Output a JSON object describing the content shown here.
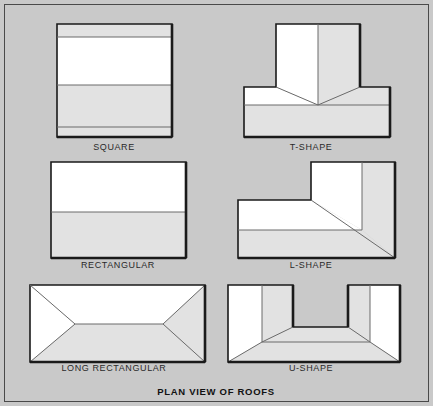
{
  "figure": {
    "caption": "PLAN VIEW OF ROOFS",
    "background_color": "#c9c9c9",
    "frame_color": "#4a4a4a",
    "face_light_color": "#ffffff",
    "face_shade_color": "#e2e2e2",
    "outline_color": "#1a1a1a",
    "ridge_line_color": "#6b6b6b"
  },
  "diagrams": [
    {
      "id": "square",
      "label": "SQUARE",
      "roof_type": "gable",
      "description": "Square plan with ridge running horizontally and narrow eave bands top and bottom",
      "label_x": 114,
      "label_y": 150,
      "outline": "57,24 172,24 172,137 57,137",
      "faces": [
        {
          "name": "upper-eave-band",
          "shade": "shade",
          "points": "57,24 172,24 172,37 57,37"
        },
        {
          "name": "upper-slope",
          "shade": "light",
          "points": "57,37 172,37 172,85 57,85"
        },
        {
          "name": "lower-slope",
          "shade": "shade",
          "points": "57,85 172,85 172,127 57,127"
        },
        {
          "name": "lower-eave-band",
          "shade": "shade",
          "points": "57,127 172,127 172,137 57,137"
        }
      ],
      "lines": [
        "57,37 172,37",
        "57,85 172,85",
        "57,127 172,127"
      ],
      "heavy_edges": [
        "57,137 172,137",
        "172,24 172,137"
      ]
    },
    {
      "id": "t-shape",
      "label": "T-SHAPE",
      "roof_type": "intersecting-gable",
      "description": "T plan with vertical ridge down the stem meeting a horizontal main ridge at a valley point",
      "label_x": 311,
      "label_y": 150,
      "outline": "276,24 360,24 360,87 390,87 390,137 244,137 244,87 276,87",
      "faces": [
        {
          "name": "stem-left-slope",
          "shade": "light",
          "points": "276,24 318,24 318,105 276,87"
        },
        {
          "name": "stem-right-slope",
          "shade": "shade",
          "points": "318,24 360,24 360,87 318,105"
        },
        {
          "name": "main-upper-left",
          "shade": "light",
          "points": "244,87 276,87 318,105 244,105"
        },
        {
          "name": "main-upper-right",
          "shade": "shade",
          "points": "360,87 390,87 390,105 318,105"
        },
        {
          "name": "main-lower-slope",
          "shade": "shade",
          "points": "244,105 390,105 390,137 244,137"
        }
      ],
      "lines": [
        "318,24 318,105",
        "276,87 318,105",
        "360,87 318,105",
        "244,105 390,105"
      ],
      "heavy_edges": [
        "244,137 390,137",
        "360,24 360,87",
        "390,87 390,137"
      ]
    },
    {
      "id": "rectangular",
      "label": "RECTANGULAR",
      "roof_type": "gable",
      "description": "Wide rectangular plan split by a single horizontal ridge line",
      "label_x": 118,
      "label_y": 268,
      "outline": "51,162 186,162 186,258 51,258",
      "faces": [
        {
          "name": "upper-slope",
          "shade": "light",
          "points": "51,162 186,162 186,212 51,212"
        },
        {
          "name": "lower-slope",
          "shade": "shade",
          "points": "51,212 186,212 186,258 51,258"
        }
      ],
      "lines": [
        "51,212 186,212"
      ],
      "heavy_edges": [
        "51,258 186,258",
        "186,162 186,258"
      ]
    },
    {
      "id": "l-shape",
      "label": "L-SHAPE",
      "roof_type": "intersecting-hip",
      "description": "L plan with a diagonal valley running from the inside corner to the outside corner",
      "label_x": 311,
      "label_y": 268,
      "outline": "311,162 395,162 395,258 238,258 238,200 311,200",
      "faces": [
        {
          "name": "wing-left-slope",
          "shade": "light",
          "points": "311,162 362,162 362,230 311,200"
        },
        {
          "name": "wing-right-slope",
          "shade": "shade",
          "points": "362,162 395,162 395,258 362,230"
        },
        {
          "name": "arm-upper-slope",
          "shade": "light",
          "points": "238,200 311,200 362,230 238,230"
        },
        {
          "name": "arm-lower-slope",
          "shade": "shade",
          "points": "238,230 362,230 395,258 238,258"
        }
      ],
      "lines": [
        "362,162 362,230",
        "311,200 395,258",
        "238,230 362,230"
      ],
      "heavy_edges": [
        "238,258 395,258",
        "395,162 395,258"
      ]
    },
    {
      "id": "long-rectangular",
      "label": "LONG RECTANGULAR",
      "roof_type": "hip",
      "description": "Long rectangular hip roof with a central ridge and four hip lines to the corners",
      "label_x": 114,
      "label_y": 371,
      "outline": "30,285 205,285 205,362 30,362",
      "faces": [
        {
          "name": "left-hip",
          "shade": "light",
          "points": "30,285 75,324 30,362"
        },
        {
          "name": "top-slope",
          "shade": "light",
          "points": "30,285 205,285 163,324 75,324"
        },
        {
          "name": "right-hip",
          "shade": "shade",
          "points": "205,285 205,362 163,324"
        },
        {
          "name": "bottom-slope",
          "shade": "shade",
          "points": "75,324 163,324 205,362 30,362"
        }
      ],
      "lines": [
        "30,285 75,324",
        "205,285 163,324",
        "75,324 163,324",
        "30,362 75,324",
        "205,362 163,324"
      ],
      "heavy_edges": [
        "30,362 205,362",
        "205,285 205,362"
      ]
    },
    {
      "id": "u-shape",
      "label": "U-SHAPE",
      "roof_type": "intersecting-hip",
      "description": "U plan with two wings, each with a vertical ridge, joined by a horizontal ridge across the base",
      "label_x": 311,
      "label_y": 371,
      "outline": "228,285 293,285 293,327 348,327 348,285 400,285 400,362 228,362",
      "faces": [
        {
          "name": "left-wing-outer-slope",
          "shade": "light",
          "points": "228,285 262,285 262,342 228,362"
        },
        {
          "name": "left-wing-inner-slope",
          "shade": "shade",
          "points": "262,285 293,285 293,327 262,342"
        },
        {
          "name": "right-wing-inner-slope",
          "shade": "shade",
          "points": "348,285 370,285 370,342 348,327"
        },
        {
          "name": "right-wing-outer-slope",
          "shade": "light",
          "points": "370,285 400,285 400,362 370,342"
        },
        {
          "name": "base-upper-slope",
          "shade": "shade",
          "points": "293,327 348,327 370,342 262,342"
        },
        {
          "name": "base-lower-slope",
          "shade": "shade",
          "points": "262,342 370,342 400,362 228,362"
        }
      ],
      "lines": [
        "262,285 262,342",
        "370,285 370,342",
        "293,327 262,342",
        "348,327 370,342",
        "262,342 370,342",
        "228,362 262,342",
        "400,362 370,342"
      ],
      "heavy_edges": [
        "228,362 400,362",
        "293,285 293,327",
        "348,285 348,327",
        "400,285 400,362"
      ]
    }
  ]
}
